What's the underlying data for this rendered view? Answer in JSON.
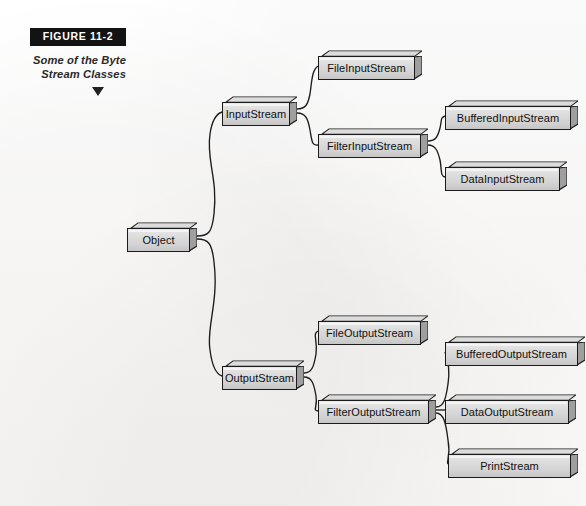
{
  "figure": {
    "tag": "FIGURE  11-2",
    "caption_line1": "Some of the Byte",
    "caption_line2": "Stream Classes",
    "arrow_icon": "down-triangle-icon"
  },
  "diagram": {
    "type": "class-hierarchy-tree",
    "root": "Object",
    "nodes": [
      {
        "id": "object",
        "label": "Object",
        "x": 127,
        "y": 222,
        "w": 70,
        "h": 30
      },
      {
        "id": "input-stream",
        "label": "InputStream",
        "x": 222,
        "y": 96,
        "w": 75,
        "h": 30
      },
      {
        "id": "file-input-stream",
        "label": "FileInputStream",
        "x": 318,
        "y": 50,
        "w": 104,
        "h": 30
      },
      {
        "id": "filter-input-stream",
        "label": "FilterInputStream",
        "x": 318,
        "y": 128,
        "w": 110,
        "h": 30
      },
      {
        "id": "buffered-input-stream",
        "label": "BufferedInputStream",
        "x": 445,
        "y": 100,
        "w": 133,
        "h": 30
      },
      {
        "id": "data-input-stream",
        "label": "DataInputStream",
        "x": 445,
        "y": 161,
        "w": 122,
        "h": 30
      },
      {
        "id": "output-stream",
        "label": "OutputStream",
        "x": 222,
        "y": 360,
        "w": 82,
        "h": 30
      },
      {
        "id": "file-output-stream",
        "label": "FileOutputStream",
        "x": 318,
        "y": 315,
        "w": 110,
        "h": 30
      },
      {
        "id": "filter-output-stream",
        "label": "FilterOutputStream",
        "x": 318,
        "y": 394,
        "w": 118,
        "h": 30
      },
      {
        "id": "buffered-output-stream",
        "label": "BufferedOutputStream",
        "x": 445,
        "y": 336,
        "w": 140,
        "h": 30
      },
      {
        "id": "data-output-stream",
        "label": "DataOutputStream",
        "x": 445,
        "y": 394,
        "w": 131,
        "h": 30
      },
      {
        "id": "print-stream",
        "label": "PrintStream",
        "x": 448,
        "y": 448,
        "w": 130,
        "h": 30
      }
    ],
    "edges": [
      {
        "from": "object",
        "to": "input-stream"
      },
      {
        "from": "object",
        "to": "output-stream"
      },
      {
        "from": "input-stream",
        "to": "file-input-stream"
      },
      {
        "from": "input-stream",
        "to": "filter-input-stream"
      },
      {
        "from": "filter-input-stream",
        "to": "buffered-input-stream"
      },
      {
        "from": "filter-input-stream",
        "to": "data-input-stream"
      },
      {
        "from": "output-stream",
        "to": "file-output-stream"
      },
      {
        "from": "output-stream",
        "to": "filter-output-stream"
      },
      {
        "from": "filter-output-stream",
        "to": "buffered-output-stream"
      },
      {
        "from": "filter-output-stream",
        "to": "data-output-stream"
      },
      {
        "from": "filter-output-stream",
        "to": "print-stream"
      }
    ]
  },
  "colors": {
    "box_border": "#1b1b1b",
    "box_face_light": "#e9e9e9",
    "box_face_dark": "#c6c6c6",
    "connector": "#1c1c1c",
    "tag_background": "#131313",
    "tag_text": "#ffffff",
    "page_background": "#fdfdfc"
  }
}
